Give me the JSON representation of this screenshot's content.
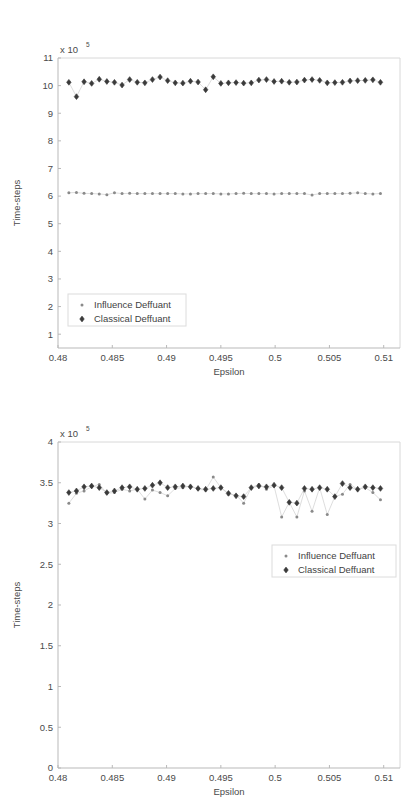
{
  "chart_data": [
    {
      "type": "scatter",
      "title": "",
      "xlabel": "Epsilon",
      "ylabel": "Time-steps",
      "y_exponent_label": "x 10",
      "y_exponent_power": "5",
      "xlim": [
        0.48,
        0.5115
      ],
      "ylim": [
        0.5,
        11
      ],
      "xticks": [
        0.48,
        0.485,
        0.49,
        0.495,
        0.5,
        0.505,
        0.51
      ],
      "xticklabels": [
        "0.48",
        "0.485",
        "0.49",
        "0.495",
        "0.5",
        "0.505",
        "0.51"
      ],
      "yticks": [
        1,
        2,
        3,
        4,
        5,
        6,
        7,
        8,
        9,
        10,
        11
      ],
      "yticklabels": [
        "1",
        "2",
        "3",
        "4",
        "5",
        "6",
        "7",
        "8",
        "9",
        "10",
        "11"
      ],
      "grid": false,
      "legend_position": "lower-left",
      "x": [
        0.481,
        0.4817,
        0.4824,
        0.4831,
        0.4838,
        0.4845,
        0.4852,
        0.4859,
        0.4866,
        0.4873,
        0.488,
        0.4887,
        0.4894,
        0.4901,
        0.4908,
        0.4915,
        0.4922,
        0.4929,
        0.4936,
        0.4943,
        0.495,
        0.4957,
        0.4964,
        0.4971,
        0.4978,
        0.4985,
        0.4992,
        0.4999,
        0.5006,
        0.5013,
        0.502,
        0.5027,
        0.5034,
        0.5041,
        0.5048,
        0.5055,
        0.5062,
        0.5069,
        0.5076,
        0.5083,
        0.509,
        0.5097
      ],
      "series": [
        {
          "name": "Influence Deffuant",
          "marker": "dot",
          "color": "#8a8a8a",
          "values": [
            6.12,
            6.13,
            6.1,
            6.09,
            6.08,
            6.05,
            6.12,
            6.09,
            6.1,
            6.09,
            6.09,
            6.09,
            6.09,
            6.09,
            6.09,
            6.08,
            6.08,
            6.09,
            6.09,
            6.09,
            6.08,
            6.08,
            6.09,
            6.1,
            6.09,
            6.09,
            6.09,
            6.08,
            6.09,
            6.09,
            6.09,
            6.09,
            6.04,
            6.09,
            6.09,
            6.09,
            6.09,
            6.1,
            6.12,
            6.09,
            6.08,
            6.09
          ]
        },
        {
          "name": "Classical Deffuant",
          "marker": "diamond",
          "color": "#3a3a3a",
          "values": [
            10.12,
            9.6,
            10.14,
            10.08,
            10.23,
            10.15,
            10.12,
            10.02,
            10.22,
            10.12,
            10.1,
            10.22,
            10.31,
            10.18,
            10.1,
            10.09,
            10.16,
            10.13,
            9.85,
            10.32,
            10.08,
            10.1,
            10.11,
            10.09,
            10.1,
            10.2,
            10.22,
            10.15,
            10.16,
            10.12,
            10.13,
            10.2,
            10.22,
            10.19,
            10.1,
            10.11,
            10.12,
            10.17,
            10.18,
            10.19,
            10.21,
            10.12
          ]
        }
      ]
    },
    {
      "type": "scatter",
      "title": "",
      "xlabel": "Epsilon",
      "ylabel": "Time-steps",
      "y_exponent_label": "x 10",
      "y_exponent_power": "5",
      "xlim": [
        0.48,
        0.5115
      ],
      "ylim": [
        0,
        4
      ],
      "xticks": [
        0.48,
        0.485,
        0.49,
        0.495,
        0.5,
        0.505,
        0.51
      ],
      "xticklabels": [
        "0.48",
        "0.485",
        "0.49",
        "0.495",
        "0.5",
        "0.505",
        "0.51"
      ],
      "yticks": [
        0,
        0.5,
        1,
        1.5,
        2,
        2.5,
        3,
        3.5,
        4
      ],
      "yticklabels": [
        "0",
        "0.5",
        "1",
        "1.5",
        "2",
        "2.5",
        "3",
        "3.5",
        "4"
      ],
      "grid": false,
      "legend_position": "middle-right",
      "x": [
        0.481,
        0.4817,
        0.4824,
        0.4831,
        0.4838,
        0.4845,
        0.4852,
        0.4859,
        0.4866,
        0.4873,
        0.488,
        0.4887,
        0.4894,
        0.4901,
        0.4908,
        0.4915,
        0.4922,
        0.4929,
        0.4936,
        0.4943,
        0.495,
        0.4957,
        0.4964,
        0.4971,
        0.4978,
        0.4985,
        0.4992,
        0.4999,
        0.5006,
        0.5013,
        0.502,
        0.5027,
        0.5034,
        0.5041,
        0.5048,
        0.5055,
        0.5062,
        0.5069,
        0.5076,
        0.5083,
        0.509,
        0.5097
      ],
      "series": [
        {
          "name": "Influence Deffuant",
          "marker": "dot",
          "color": "#8a8a8a",
          "values": [
            3.25,
            3.37,
            3.4,
            3.45,
            3.48,
            3.37,
            3.38,
            3.42,
            3.4,
            3.42,
            3.3,
            3.41,
            3.38,
            3.34,
            3.43,
            3.44,
            3.46,
            3.42,
            3.41,
            3.57,
            3.44,
            3.36,
            3.35,
            3.25,
            3.44,
            3.48,
            3.42,
            3.46,
            3.08,
            3.26,
            3.08,
            3.4,
            3.15,
            3.44,
            3.11,
            3.33,
            3.36,
            3.48,
            3.42,
            3.44,
            3.38,
            3.29
          ]
        },
        {
          "name": "Classical Deffuant",
          "marker": "diamond",
          "color": "#3a3a3a",
          "values": [
            3.38,
            3.4,
            3.45,
            3.46,
            3.44,
            3.38,
            3.4,
            3.44,
            3.45,
            3.42,
            3.43,
            3.47,
            3.5,
            3.44,
            3.45,
            3.46,
            3.45,
            3.43,
            3.42,
            3.43,
            3.44,
            3.37,
            3.34,
            3.33,
            3.44,
            3.46,
            3.45,
            3.47,
            3.44,
            3.26,
            3.25,
            3.43,
            3.42,
            3.44,
            3.42,
            3.33,
            3.49,
            3.44,
            3.42,
            3.45,
            3.44,
            3.43
          ]
        }
      ]
    }
  ]
}
